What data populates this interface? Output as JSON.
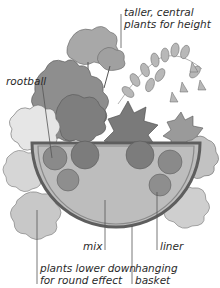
{
  "diagram": {
    "type": "hanging basket planting illustration",
    "labels": {
      "taller": [
        "taller, central",
        "plants for height"
      ],
      "rootball": "rootball",
      "mix": "mix",
      "liner": "liner",
      "lower_plants": [
        "plants lower down",
        "for round effect"
      ],
      "basket": [
        "hanging",
        "basket"
      ]
    },
    "colors": {
      "foliage_dark": "#8a8a8a",
      "foliage_mid": "#a8a8a8",
      "foliage_light": "#cfcfcf",
      "basket_rim": "#6e6e6e",
      "mix": "#bdbdbd",
      "leader_line": "#555555"
    }
  }
}
